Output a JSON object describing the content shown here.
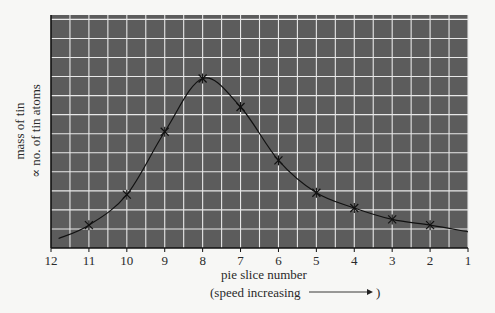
{
  "chart_data": {
    "type": "line",
    "title": "",
    "xlabel": "pie slice number",
    "xlabel_sub": "(speed increasing",
    "xlabel_sub_end": ")",
    "ylabel_line1": "mass of tin",
    "ylabel_line2": "∝ no. of tin atoms",
    "x_ticks": [
      12,
      11,
      10,
      9,
      8,
      7,
      6,
      5,
      4,
      3,
      2,
      1
    ],
    "x_reversed": true,
    "y_ticks": [],
    "grid": true,
    "grid_minor_x": 0.5,
    "ylim": [
      0,
      12.2
    ],
    "xlim": [
      12,
      1
    ],
    "series": [
      {
        "name": "mass of tin",
        "marker": "x",
        "x": [
          11,
          10,
          9,
          8,
          7,
          6,
          5,
          4,
          3,
          2
        ],
        "values": [
          1.2,
          2.8,
          6.1,
          8.9,
          7.4,
          4.6,
          2.9,
          2.1,
          1.5,
          1.2
        ]
      }
    ],
    "curve_extension": {
      "start": {
        "x": 11.8,
        "y": 0.5
      },
      "end": {
        "x": 1.0,
        "y": 0.85
      }
    }
  },
  "colors": {
    "plot_bg": "#5c5c5c",
    "grid": "#e8e8e8",
    "line": "#111111",
    "page_bg": "#f7f7f5"
  }
}
